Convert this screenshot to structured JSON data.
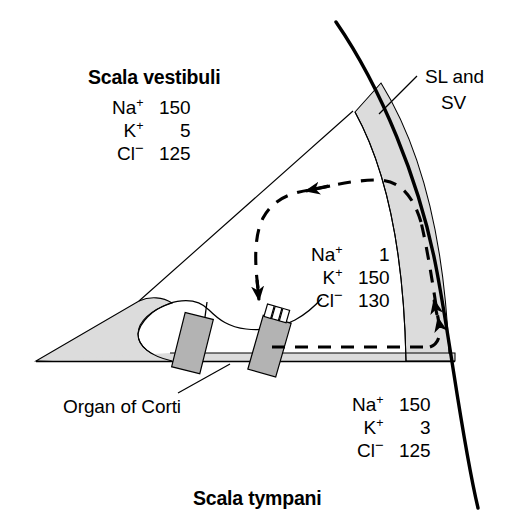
{
  "figure": {
    "background_color": "#ffffff",
    "line_color": "#000000",
    "shade_light": "#dcdcdc",
    "shade_mid": "#b3b3b3"
  },
  "labels": {
    "scala_vestibuli": "Scala vestibuli",
    "scala_tympani": "Scala tympani",
    "sl_and_sv_line1": "SL and",
    "sl_and_sv_line2": "SV",
    "organ_of_corti": "Organ of Corti"
  },
  "ion_blocks": {
    "scala_vestibuli": {
      "region": "Scala vestibuli",
      "rows": [
        {
          "ion": "Na",
          "charge": "+",
          "value": "150"
        },
        {
          "ion": "K",
          "charge": "+",
          "value": "5"
        },
        {
          "ion": "Cl",
          "charge": "−",
          "value": "125"
        }
      ]
    },
    "scala_media": {
      "region": "Scala media (endolymph)",
      "rows": [
        {
          "ion": "Na",
          "charge": "+",
          "value": "1"
        },
        {
          "ion": "K",
          "charge": "+",
          "value": "150"
        },
        {
          "ion": "Cl",
          "charge": "−",
          "value": "130"
        }
      ]
    },
    "scala_tympani": {
      "region": "Scala tympani",
      "rows": [
        {
          "ion": "Na",
          "charge": "+",
          "value": "150"
        },
        {
          "ion": "K",
          "charge": "+",
          "value": "3"
        },
        {
          "ion": "Cl",
          "charge": "−",
          "value": "125"
        }
      ]
    }
  },
  "structures": {
    "outer_bony_wall": "outer bony wall",
    "stria_band": "spiral ligament and stria vascularis band",
    "reissner_membrane": "Reissner's membrane",
    "basilar_membrane": "basilar membrane",
    "spiral_limbus": "spiral limbus wedge",
    "tectorial_membrane": "tectorial membrane",
    "inner_hair_cell": "inner hair cell",
    "outer_hair_cell": "outer hair cell",
    "stereocilia": "stereocilia",
    "recycling_arrow": "dashed potassium recycling pathway"
  }
}
